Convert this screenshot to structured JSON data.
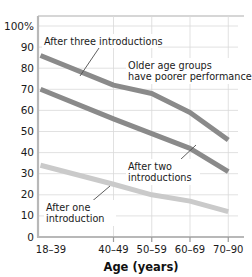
{
  "chart_data": {
    "type": "line",
    "title": "",
    "xlabel": "Age (years)",
    "ylabel": "",
    "categories": [
      "18–39",
      "40–49",
      "50–59",
      "60–69",
      "70–90"
    ],
    "ylim": [
      0,
      100
    ],
    "yticks": [
      0,
      10,
      20,
      30,
      40,
      50,
      60,
      70,
      80,
      90,
      100
    ],
    "ytick_labels": [
      "0",
      "10",
      "20",
      "30",
      "40",
      "50",
      "60",
      "70",
      "80",
      "90",
      "100%"
    ],
    "grid": true,
    "legend": "none",
    "series": [
      {
        "name": "After three introductions",
        "values": [
          86,
          72,
          68,
          59,
          46
        ],
        "color": "#8a8a8a"
      },
      {
        "name": "After two introductions",
        "values": [
          70,
          56,
          49,
          42,
          31
        ],
        "color": "#8a8a8a"
      },
      {
        "name": "After one introduction",
        "values": [
          34,
          25,
          20,
          17,
          12
        ],
        "color": "#cacaca"
      }
    ],
    "annotations": [
      {
        "id": "after-three",
        "lines": [
          "After three introductions"
        ],
        "text": "After three introductions"
      },
      {
        "id": "older-age",
        "lines": [
          "Older age groups",
          "have poorer performance"
        ],
        "line1": "Older age groups",
        "line2": "have poorer performance"
      },
      {
        "id": "after-two",
        "lines": [
          "After two",
          "introductions"
        ],
        "line1": "After two",
        "line2": "introductions"
      },
      {
        "id": "after-one",
        "lines": [
          "After one",
          "introduction"
        ],
        "line1": "After one",
        "line2": "introduction"
      }
    ]
  },
  "axis": {
    "x_title": "Age (years)",
    "y_top_label": "100%"
  },
  "colors": {
    "series_dark": "#8a8a8a",
    "series_light": "#cacaca",
    "grid": "#d9d9d9",
    "axis": "#b8b8b8",
    "text": "#1a1a1a"
  }
}
